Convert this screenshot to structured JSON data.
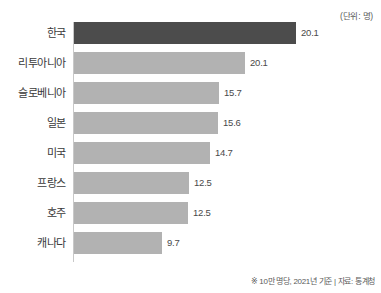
{
  "unit_note": "(단위: 명)",
  "footnote": "※ 10만 명당, 2021년 기준 | 자료: 통계청",
  "chart_data": {
    "type": "bar",
    "orientation": "horizontal",
    "title": "",
    "subtitle": "",
    "xlabel": "",
    "ylabel": "",
    "unit": "명",
    "note": "※ 10만 명당, 2021년 기준 | 자료: 통계청",
    "source": "통계청",
    "grid": false,
    "legend": false,
    "xlim": [
      0,
      20.1
    ],
    "highlight_index": 0,
    "colors": {
      "highlight_bar": "#4c4c4c",
      "bar": "#b2b2b2",
      "axis": "#c8c8c8",
      "label_text": "#3a3a3a",
      "value_text": "#4a4a4a",
      "background": "#ffffff"
    },
    "categories": [
      "한국",
      "리투아니아",
      "슬로베니아",
      "일본",
      "미국",
      "프랑스",
      "호주",
      "캐나다"
    ],
    "values": [
      20.1,
      20.1,
      15.7,
      15.6,
      14.7,
      12.5,
      12.5,
      9.7
    ],
    "value_labels": [
      "20.1",
      "20.1",
      "15.7",
      "15.6",
      "14.7",
      "12.5",
      "12.5",
      "9.7"
    ],
    "bar_pixel_widths": [
      222,
      171,
      145,
      144,
      136,
      115,
      114,
      88
    ]
  }
}
